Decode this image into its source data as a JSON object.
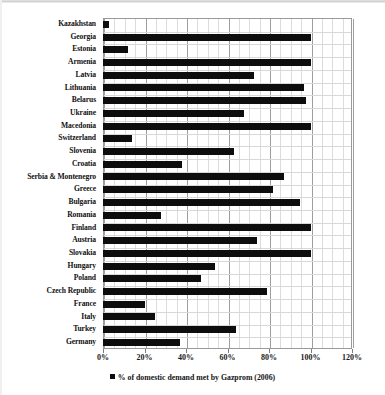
{
  "chart_data": {
    "type": "bar",
    "orientation": "horizontal",
    "title": "",
    "xlabel": "",
    "ylabel": "",
    "xlim": [
      0,
      120
    ],
    "xticks": [
      0,
      20,
      40,
      60,
      80,
      100,
      120
    ],
    "xtick_labels": [
      "0%",
      "20%",
      "40%",
      "60%",
      "80%",
      "100%",
      "120%"
    ],
    "grid": true,
    "minor_gridlines": true,
    "legend_position": "bottom",
    "legend": [
      "% of domestic demand met by Gazprom (2006)"
    ],
    "series_name": "% of domestic demand met by Gazprom (2006)",
    "bar_color": "#0d0d0d",
    "categories": [
      "Kazakhstan",
      "Georgia",
      "Estonia",
      "Armenia",
      "Latvia",
      "Lithuania",
      "Belarus",
      "Ukraine",
      "Macedonia",
      "Switzerland",
      "Slovenia",
      "Croatia",
      "Serbia & Montenegro",
      "Greece",
      "Bulgaria",
      "Romania",
      "Finland",
      "Austria",
      "Slovakia",
      "Hungary",
      "Poland",
      "Czech Republic",
      "France",
      "Italy",
      "Turkey",
      "Germany"
    ],
    "values": [
      3,
      100,
      12,
      100,
      73,
      97,
      98,
      68,
      100,
      14,
      63,
      38,
      87,
      82,
      95,
      28,
      100,
      74,
      100,
      54,
      47,
      79,
      20,
      25,
      64,
      37
    ]
  },
  "legend": {
    "label": "% of domestic demand met by Gazprom (2006)"
  }
}
